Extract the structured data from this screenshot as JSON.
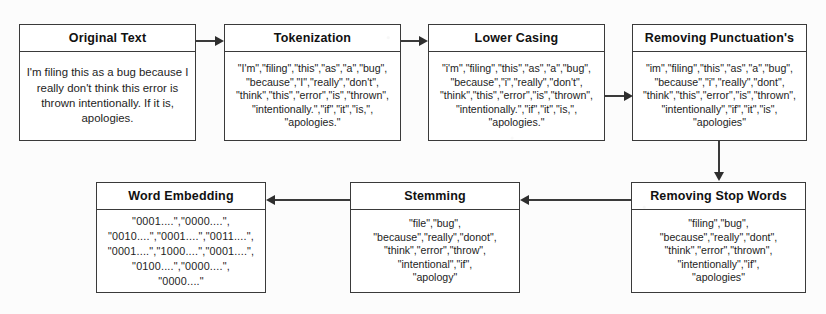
{
  "diagram": {
    "nodes": [
      {
        "id": "original-text",
        "title": "Original Text",
        "body": "I'm filing this as a bug because I really don't think this error is thrown intentionally. If it is, apologies."
      },
      {
        "id": "tokenization",
        "title": "Tokenization",
        "body": "\"I'm\",\"filing\",\"this\",\"as\",\"a\",\"bug\",\n\"because\",\"I\",\"really\",\"don't\",\n\"think\",\"this\",\"error\",\"is\",\"thrown\",\n\"intentionally.\",\"if\",\"it\",\"is,\",\n\"apologies.\""
      },
      {
        "id": "lower-casing",
        "title": "Lower Casing",
        "body": "\"i'm\",\"filing\",\"this\",\"as\",\"a\",\"bug\",\n\"because\",\"i\",\"really\",\"don't\",\n\"think\",\"this\",\"error\",\"is\",\"thrown\",\n\"intentionally.\",\"if\",\"it\",\"is,\",\n\"apologies.\""
      },
      {
        "id": "removing-punctuations",
        "title": "Removing Punctuation's",
        "body": "\"im\",\"filing\",\"this\",\"as\",\"a\",\"bug\",\n\"because\",\"i\",\"really\",\"dont\",\n\"think\",\"this\",\"error\",\"is\",\"thrown\",\n\"intentionally\",\"if\",\"it\",\"is\",\n\"apologies\""
      },
      {
        "id": "removing-stop-words",
        "title": "Removing Stop Words",
        "body": "\"filing\",\"bug\",\n\"because\",\"really\",\"dont\",\n\"think\",\"error\",\"thrown\",\n\"intentionally\",\"if\",\n\"apologies\""
      },
      {
        "id": "stemming",
        "title": "Stemming",
        "body": "\"file\",\"bug\",\n\"because\",\"really\",\"donot\",\n\"think\",\"error\",\"throw\",\n\"intentional\",\"if\",\n\"apology\""
      },
      {
        "id": "word-embedding",
        "title": "Word Embedding",
        "body": "\"0001....\",\"0000....\",\n\"0010....\",\"0001....\",\"0011....\",\n\"0001....\",\"1000....\",\"0001....\",\n\"0100....\",\"0000....\",\n\"0000....\""
      }
    ],
    "edges": [
      {
        "id": "edge-original-to-tokenization",
        "from": "original-text",
        "to": "tokenization",
        "direction": "right"
      },
      {
        "id": "edge-tokenization-to-lower-casing",
        "from": "tokenization",
        "to": "lower-casing",
        "direction": "right"
      },
      {
        "id": "edge-lower-casing-to-removing-punctuations",
        "from": "lower-casing",
        "to": "removing-punctuations",
        "direction": "right"
      },
      {
        "id": "edge-removing-punctuations-to-removing-stop-words",
        "from": "removing-punctuations",
        "to": "removing-stop-words",
        "direction": "down"
      },
      {
        "id": "edge-removing-stop-words-to-stemming",
        "from": "removing-stop-words",
        "to": "stemming",
        "direction": "left"
      },
      {
        "id": "edge-stemming-to-word-embedding",
        "from": "stemming",
        "to": "word-embedding",
        "direction": "left"
      }
    ],
    "colors": {
      "border": "#3a3a3a",
      "arrow": "#2e2e2e",
      "box_fill": "#ffffff",
      "page_background": "#fcfcfc",
      "text": "#111111"
    }
  }
}
